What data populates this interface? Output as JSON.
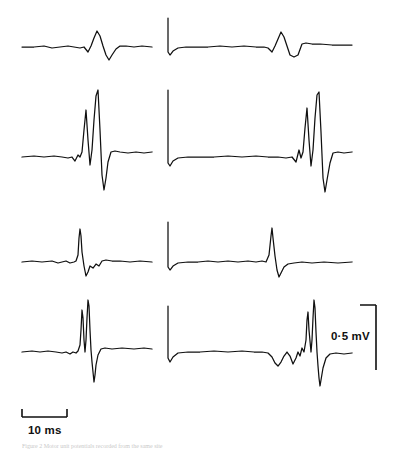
{
  "figure": {
    "background_color": "#ffffff",
    "trace_color": "#101010",
    "caption_text": "Figure  2  Motor unit potentials recorded from the same site"
  },
  "scale_bars": {
    "horizontal": {
      "label": "10 ms",
      "name": "time-scale-bar"
    },
    "vertical": {
      "label": "0·5 mV",
      "name": "amplitude-scale-bar"
    }
  },
  "chart_data": {
    "type": "line",
    "title": "",
    "xlabel": "",
    "ylabel": "",
    "grid": false,
    "legend": false,
    "scale": {
      "time_per_bar_ms": 10,
      "amplitude_per_bar_mv": 0.5
    },
    "panel_layout": {
      "rows": 4,
      "cols": 2
    },
    "series": [
      {
        "name": "row1-left",
        "row": 1,
        "col": "left",
        "baseline_y": 47,
        "x_start": 22,
        "x_end": 152,
        "stimulus_artifact": false,
        "points": [
          [
            22,
            47
          ],
          [
            34,
            47
          ],
          [
            44,
            46
          ],
          [
            52,
            48
          ],
          [
            60,
            47
          ],
          [
            68,
            46
          ],
          [
            74,
            47
          ],
          [
            80,
            48
          ],
          [
            84,
            47
          ],
          [
            88,
            52
          ],
          [
            91,
            46
          ],
          [
            94,
            38
          ],
          [
            97,
            31
          ],
          [
            100,
            36
          ],
          [
            103,
            46
          ],
          [
            106,
            55
          ],
          [
            109,
            60
          ],
          [
            112,
            55
          ],
          [
            116,
            49
          ],
          [
            120,
            46
          ],
          [
            126,
            46
          ],
          [
            134,
            47
          ],
          [
            142,
            46
          ],
          [
            152,
            47
          ]
        ]
      },
      {
        "name": "row1-right",
        "row": 1,
        "col": "right",
        "baseline_y": 47,
        "x_start": 168,
        "x_end": 352,
        "stimulus_artifact": true,
        "artifact_x": 168,
        "artifact_top_y": 18,
        "points": [
          [
            168,
            18
          ],
          [
            168,
            52
          ],
          [
            170,
            55
          ],
          [
            173,
            51
          ],
          [
            178,
            48
          ],
          [
            186,
            47
          ],
          [
            196,
            47
          ],
          [
            208,
            47
          ],
          [
            220,
            46
          ],
          [
            232,
            47
          ],
          [
            244,
            46
          ],
          [
            256,
            47
          ],
          [
            264,
            47
          ],
          [
            268,
            48
          ],
          [
            272,
            52
          ],
          [
            275,
            46
          ],
          [
            278,
            39
          ],
          [
            281,
            32
          ],
          [
            284,
            37
          ],
          [
            287,
            46
          ],
          [
            290,
            55
          ],
          [
            294,
            57
          ],
          [
            298,
            55
          ],
          [
            302,
            44
          ],
          [
            306,
            43
          ],
          [
            312,
            44
          ],
          [
            320,
            44
          ],
          [
            332,
            45
          ],
          [
            342,
            45
          ],
          [
            352,
            45
          ]
        ]
      },
      {
        "name": "row2-left",
        "row": 2,
        "col": "left",
        "baseline_y": 157,
        "x_start": 22,
        "x_end": 152,
        "stimulus_artifact": false,
        "points": [
          [
            22,
            157
          ],
          [
            34,
            156
          ],
          [
            44,
            157
          ],
          [
            54,
            156
          ],
          [
            62,
            157
          ],
          [
            68,
            158
          ],
          [
            72,
            157
          ],
          [
            75,
            161
          ],
          [
            78,
            155
          ],
          [
            80,
            157
          ],
          [
            82,
            152
          ],
          [
            84,
            130
          ],
          [
            86,
            110
          ],
          [
            88,
            140
          ],
          [
            90,
            165
          ],
          [
            92,
            150
          ],
          [
            94,
            120
          ],
          [
            96,
            96
          ],
          [
            98,
            90
          ],
          [
            100,
            130
          ],
          [
            102,
            175
          ],
          [
            104,
            190
          ],
          [
            106,
            178
          ],
          [
            108,
            162
          ],
          [
            111,
            152
          ],
          [
            115,
            151
          ],
          [
            120,
            152
          ],
          [
            128,
            153
          ],
          [
            136,
            152
          ],
          [
            144,
            153
          ],
          [
            152,
            152
          ]
        ]
      },
      {
        "name": "row2-right",
        "row": 2,
        "col": "right",
        "baseline_y": 157,
        "x_start": 168,
        "x_end": 352,
        "stimulus_artifact": true,
        "artifact_x": 168,
        "artifact_top_y": 90,
        "points": [
          [
            168,
            90
          ],
          [
            168,
            163
          ],
          [
            170,
            166
          ],
          [
            173,
            161
          ],
          [
            178,
            158
          ],
          [
            188,
            157
          ],
          [
            200,
            157
          ],
          [
            214,
            157
          ],
          [
            228,
            156
          ],
          [
            242,
            157
          ],
          [
            256,
            156
          ],
          [
            268,
            157
          ],
          [
            278,
            157
          ],
          [
            286,
            158
          ],
          [
            292,
            157
          ],
          [
            296,
            162
          ],
          [
            299,
            150
          ],
          [
            301,
            158
          ],
          [
            303,
            152
          ],
          [
            305,
            128
          ],
          [
            307,
            108
          ],
          [
            309,
            140
          ],
          [
            311,
            166
          ],
          [
            313,
            150
          ],
          [
            315,
            118
          ],
          [
            317,
            95
          ],
          [
            319,
            92
          ],
          [
            321,
            132
          ],
          [
            323,
            178
          ],
          [
            325,
            192
          ],
          [
            327,
            180
          ],
          [
            330,
            163
          ],
          [
            333,
            153
          ],
          [
            338,
            152
          ],
          [
            344,
            153
          ],
          [
            352,
            152
          ]
        ]
      },
      {
        "name": "row3-left",
        "row": 3,
        "col": "left",
        "baseline_y": 262,
        "x_start": 22,
        "x_end": 152,
        "stimulus_artifact": false,
        "points": [
          [
            22,
            262
          ],
          [
            32,
            261
          ],
          [
            42,
            262
          ],
          [
            52,
            261
          ],
          [
            58,
            263
          ],
          [
            62,
            262
          ],
          [
            66,
            261
          ],
          [
            70,
            263
          ],
          [
            74,
            262
          ],
          [
            76,
            261
          ],
          [
            78,
            255
          ],
          [
            79,
            238
          ],
          [
            80,
            229
          ],
          [
            81,
            236
          ],
          [
            82,
            252
          ],
          [
            84,
            266
          ],
          [
            86,
            276
          ],
          [
            88,
            272
          ],
          [
            90,
            266
          ],
          [
            93,
            268
          ],
          [
            96,
            264
          ],
          [
            99,
            266
          ],
          [
            102,
            261
          ],
          [
            106,
            260
          ],
          [
            112,
            261
          ],
          [
            120,
            261
          ],
          [
            130,
            262
          ],
          [
            140,
            261
          ],
          [
            152,
            262
          ]
        ]
      },
      {
        "name": "row3-right",
        "row": 3,
        "col": "right",
        "baseline_y": 262,
        "x_start": 168,
        "x_end": 352,
        "stimulus_artifact": true,
        "artifact_x": 168,
        "artifact_top_y": 222,
        "points": [
          [
            168,
            222
          ],
          [
            168,
            267
          ],
          [
            170,
            270
          ],
          [
            173,
            266
          ],
          [
            178,
            263
          ],
          [
            188,
            262
          ],
          [
            198,
            262
          ],
          [
            208,
            261
          ],
          [
            218,
            262
          ],
          [
            228,
            261
          ],
          [
            238,
            262
          ],
          [
            248,
            261
          ],
          [
            256,
            262
          ],
          [
            262,
            261
          ],
          [
            266,
            262
          ],
          [
            269,
            255
          ],
          [
            271,
            236
          ],
          [
            272,
            228
          ],
          [
            273,
            238
          ],
          [
            275,
            256
          ],
          [
            277,
            270
          ],
          [
            279,
            277
          ],
          [
            281,
            273
          ],
          [
            284,
            267
          ],
          [
            288,
            264
          ],
          [
            294,
            263
          ],
          [
            302,
            262
          ],
          [
            312,
            263
          ],
          [
            324,
            262
          ],
          [
            338,
            263
          ],
          [
            352,
            262
          ]
        ]
      },
      {
        "name": "row4-left",
        "row": 4,
        "col": "left",
        "baseline_y": 352,
        "x_start": 22,
        "x_end": 152,
        "stimulus_artifact": false,
        "points": [
          [
            22,
            352
          ],
          [
            32,
            351
          ],
          [
            40,
            352
          ],
          [
            48,
            351
          ],
          [
            56,
            352
          ],
          [
            62,
            353
          ],
          [
            66,
            352
          ],
          [
            70,
            354
          ],
          [
            73,
            352
          ],
          [
            76,
            353
          ],
          [
            78,
            351
          ],
          [
            80,
            345
          ],
          [
            81,
            330
          ],
          [
            82,
            310
          ],
          [
            83,
            318
          ],
          [
            84,
            340
          ],
          [
            85,
            352
          ],
          [
            86,
            340
          ],
          [
            87,
            318
          ],
          [
            88,
            300
          ],
          [
            89,
            306
          ],
          [
            90,
            330
          ],
          [
            91,
            350
          ],
          [
            92,
            362
          ],
          [
            93,
            372
          ],
          [
            94,
            382
          ],
          [
            95,
            375
          ],
          [
            96,
            365
          ],
          [
            98,
            355
          ],
          [
            101,
            349
          ],
          [
            105,
            348
          ],
          [
            112,
            349
          ],
          [
            122,
            348
          ],
          [
            134,
            349
          ],
          [
            144,
            348
          ],
          [
            152,
            349
          ]
        ]
      },
      {
        "name": "row4-right",
        "row": 4,
        "col": "right",
        "baseline_y": 352,
        "x_start": 168,
        "x_end": 352,
        "stimulus_artifact": true,
        "artifact_x": 168,
        "artifact_top_y": 306,
        "points": [
          [
            168,
            306
          ],
          [
            168,
            358
          ],
          [
            170,
            362
          ],
          [
            173,
            357
          ],
          [
            178,
            353
          ],
          [
            188,
            352
          ],
          [
            200,
            352
          ],
          [
            214,
            351
          ],
          [
            228,
            352
          ],
          [
            242,
            351
          ],
          [
            254,
            352
          ],
          [
            262,
            352
          ],
          [
            268,
            353
          ],
          [
            272,
            357
          ],
          [
            275,
            363
          ],
          [
            278,
            366
          ],
          [
            281,
            362
          ],
          [
            284,
            356
          ],
          [
            287,
            352
          ],
          [
            290,
            356
          ],
          [
            293,
            364
          ],
          [
            296,
            358
          ],
          [
            298,
            352
          ],
          [
            300,
            356
          ],
          [
            302,
            348
          ],
          [
            304,
            352
          ],
          [
            306,
            340
          ],
          [
            307,
            320
          ],
          [
            308,
            312
          ],
          [
            309,
            330
          ],
          [
            311,
            352
          ],
          [
            312,
            340
          ],
          [
            313,
            318
          ],
          [
            314,
            300
          ],
          [
            315,
            308
          ],
          [
            316,
            332
          ],
          [
            317,
            352
          ],
          [
            318,
            366
          ],
          [
            319,
            378
          ],
          [
            320,
            386
          ],
          [
            321,
            380
          ],
          [
            323,
            368
          ],
          [
            326,
            358
          ],
          [
            330,
            354
          ],
          [
            336,
            353
          ],
          [
            344,
            354
          ],
          [
            352,
            353
          ]
        ]
      }
    ]
  }
}
